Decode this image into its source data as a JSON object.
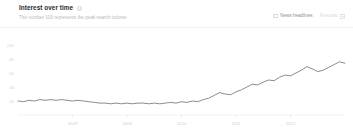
{
  "panel": {
    "title": "Interest over time",
    "subtitle": "The number 100 represents the peak search volume",
    "help_icon": "?"
  },
  "controls": {
    "news_headlines": {
      "label": "News headlines",
      "checked": false
    },
    "forecast": {
      "label": "Forecast",
      "enabled": false
    }
  },
  "colors": {
    "line": "#666666",
    "axis": "#e9e9e9",
    "tick_text": "#d0d0d0",
    "title_text": "#2b2b2b",
    "subtitle_text": "#b9b9b9",
    "background": "#ffffff"
  },
  "chart_data": {
    "type": "line",
    "title": "Interest over time",
    "subtitle": "The number 100 represents the peak search volume",
    "xlabel": "",
    "ylabel": "",
    "xlim": [
      2007.0,
      2013.0
    ],
    "ylim": [
      0,
      110
    ],
    "yticks": [
      100,
      80,
      60,
      40,
      20
    ],
    "ytick_labels": [
      "100",
      "80",
      "60",
      "40",
      "20"
    ],
    "xticks": [
      2008,
      2009,
      2010,
      2011,
      2012
    ],
    "xtick_labels": [
      "2008",
      "2009",
      "2010",
      "2011",
      "2012"
    ],
    "grid": false,
    "legend": null,
    "series": [
      {
        "name": "Search interest",
        "x": [
          2007.0,
          2007.1,
          2007.2,
          2007.3,
          2007.4,
          2007.5,
          2007.6,
          2007.7,
          2007.8,
          2007.9,
          2008.0,
          2008.1,
          2008.2,
          2008.3,
          2008.4,
          2008.5,
          2008.6,
          2008.7,
          2008.8,
          2008.9,
          2009.0,
          2009.1,
          2009.2,
          2009.3,
          2009.4,
          2009.5,
          2009.6,
          2009.7,
          2009.8,
          2009.9,
          2010.0,
          2010.1,
          2010.2,
          2010.3,
          2010.4,
          2010.5,
          2010.6,
          2010.7,
          2010.8,
          2010.9,
          2011.0,
          2011.1,
          2011.2,
          2011.3,
          2011.4,
          2011.5,
          2011.6,
          2011.7,
          2011.8,
          2011.9,
          2012.0,
          2012.1,
          2012.2,
          2012.3,
          2012.4,
          2012.5,
          2012.6,
          2012.7,
          2012.8,
          2012.9,
          2013.0
        ],
        "values": [
          20,
          19,
          21,
          20,
          22,
          21,
          22,
          21,
          22,
          21,
          20,
          21,
          20,
          19,
          18,
          17,
          17,
          16,
          17,
          16,
          17,
          16,
          17,
          17,
          16,
          17,
          16,
          17,
          18,
          17,
          19,
          18,
          20,
          19,
          22,
          24,
          28,
          32,
          30,
          29,
          33,
          36,
          40,
          44,
          43,
          47,
          50,
          49,
          54,
          57,
          56,
          60,
          64,
          69,
          66,
          62,
          64,
          68,
          72,
          76,
          74
        ]
      }
    ],
    "peak_value": 100,
    "peak_note": "The number 100 represents the peak search volume"
  }
}
